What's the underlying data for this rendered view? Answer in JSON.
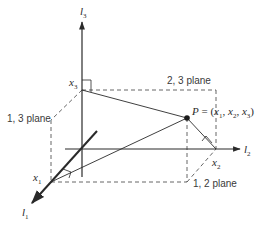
{
  "diagram": {
    "axes": [
      {
        "id": "l1",
        "label": "l",
        "sub": "1"
      },
      {
        "id": "l2",
        "label": "l",
        "sub": "2"
      },
      {
        "id": "l3",
        "label": "l",
        "sub": "3"
      }
    ],
    "coordinates": [
      {
        "id": "x1",
        "label": "x",
        "sub": "1"
      },
      {
        "id": "x2",
        "label": "x",
        "sub": "2"
      },
      {
        "id": "x3",
        "label": "x",
        "sub": "3"
      }
    ],
    "point": {
      "name": "P",
      "equals": " = (",
      "x1": "x",
      "x1_sub": "1",
      "sep1": ", ",
      "x2": "x",
      "x2_sub": "2",
      "sep2": ", ",
      "x3": "x",
      "x3_sub": "3",
      "close": ")"
    },
    "planes": {
      "p23": "2, 3 plane",
      "p13": "1, 3 plane",
      "p12": "1, 2 plane"
    },
    "colors": {
      "stroke": "#2a2a2a",
      "dashed": "#555555"
    }
  }
}
